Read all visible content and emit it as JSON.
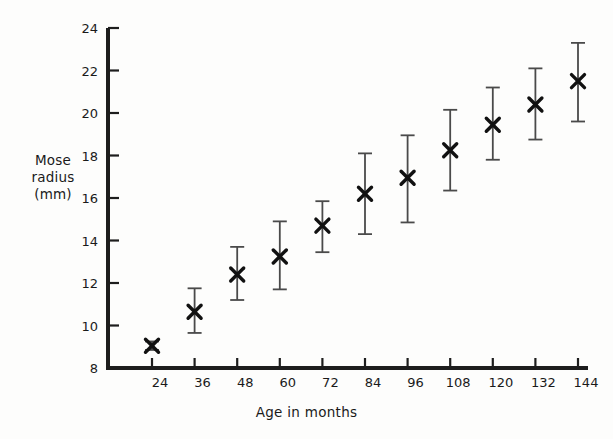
{
  "chart_data": {
    "type": "scatter",
    "title": "",
    "subtitle": "",
    "xlabel": "Age in months",
    "ylabel": "Mose radius (mm)",
    "ylabel_lines": [
      "Mose",
      "radius",
      "(mm)"
    ],
    "x": [
      24,
      36,
      48,
      60,
      72,
      84,
      96,
      108,
      120,
      132,
      144
    ],
    "xtick_labels": [
      "24",
      "36",
      "48",
      "60",
      "72",
      "84",
      "96",
      "108",
      "120",
      "132",
      "144"
    ],
    "ytick_labels": [
      "8",
      "10",
      "12",
      "14",
      "16",
      "18",
      "20",
      "22",
      "24"
    ],
    "yticks": [
      8,
      10,
      12,
      14,
      16,
      18,
      20,
      22,
      24
    ],
    "xlim": [
      18,
      150
    ],
    "ylim": [
      8,
      24
    ],
    "grid": false,
    "legend": null,
    "marker": "x",
    "error_bars": "vertical-with-caps",
    "series": [
      {
        "name": "Mose radius",
        "values": [
          9.05,
          10.65,
          12.4,
          13.25,
          14.7,
          16.2,
          16.95,
          18.25,
          19.45,
          20.4,
          21.5
        ],
        "err_low": [
          8.85,
          9.65,
          11.2,
          11.7,
          13.45,
          14.3,
          14.85,
          16.35,
          17.8,
          18.75,
          19.6
        ],
        "err_high": [
          9.25,
          11.75,
          13.7,
          14.9,
          15.85,
          18.1,
          18.95,
          20.15,
          21.2,
          22.1,
          23.3
        ]
      }
    ],
    "axis_color": "#1d1d1d",
    "marker_color": "#111111",
    "errorbar_color": "#4a4a4a",
    "background_color": "#fdfdfc"
  }
}
